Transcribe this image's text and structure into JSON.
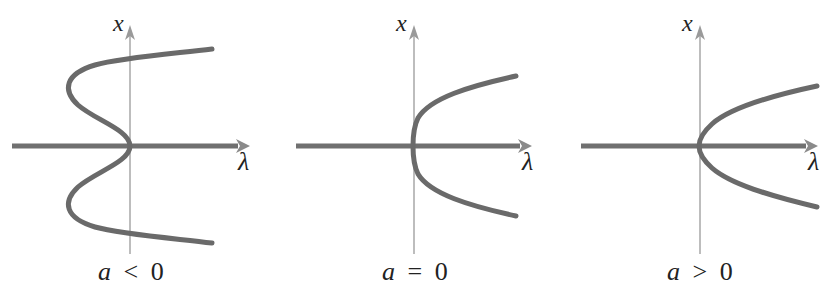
{
  "figure": {
    "panels": [
      {
        "id": "a-negative",
        "x_axis_label": "x",
        "h_axis_label": "λ",
        "caption_var": "a",
        "caption_op": "<",
        "caption_val": "0"
      },
      {
        "id": "a-zero",
        "x_axis_label": "x",
        "h_axis_label": "λ",
        "caption_var": "a",
        "caption_op": "=",
        "caption_val": "0"
      },
      {
        "id": "a-positive",
        "x_axis_label": "x",
        "h_axis_label": "λ",
        "caption_var": "a",
        "caption_op": ">",
        "caption_val": "0"
      }
    ],
    "colors": {
      "curve": "#6a6a6a",
      "vertical_axis": "#9a9a9a",
      "horizontal_axis": "#707070",
      "text": "#222222"
    }
  }
}
